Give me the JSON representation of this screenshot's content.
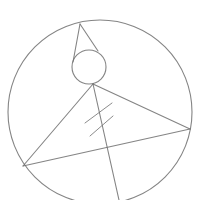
{
  "diagram": {
    "stroke_color": "#6e6e6e",
    "background": "#ffffff",
    "big_circle": {
      "cx": 100,
      "cy": 112,
      "r": 92
    },
    "small_circle": {
      "cx": 89,
      "cy": 67,
      "r": 17
    },
    "points": {
      "apex": {
        "x": 80,
        "y": 24
      },
      "tangent_left": {
        "x": 73,
        "y": 62
      },
      "tangent_right": {
        "x": 98,
        "y": 51
      },
      "vertex_top": {
        "x": 93,
        "y": 84
      },
      "vertex_left": {
        "x": 23,
        "y": 166
      },
      "vertex_right": {
        "x": 190,
        "y": 129
      },
      "bottom_end": {
        "x": 119,
        "y": 200
      }
    },
    "tick_marks": [
      {
        "x1": 85,
        "y1": 123,
        "x2": 112,
        "y2": 103
      },
      {
        "x1": 90,
        "y1": 136,
        "x2": 113,
        "y2": 116
      }
    ],
    "labels": []
  }
}
